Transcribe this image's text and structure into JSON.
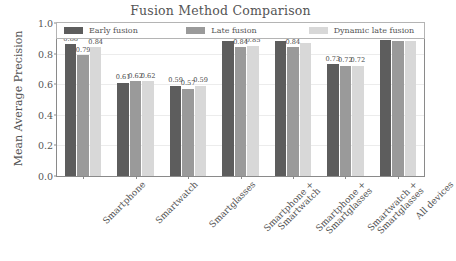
{
  "chart_data": {
    "type": "bar",
    "title": "Fusion Method Comparison",
    "xlabel": "",
    "ylabel": "Mean Average Precision",
    "ylim": [
      0.0,
      1.0
    ],
    "yticks": [
      "0.0",
      "0.2",
      "0.4",
      "0.6",
      "0.8",
      "1.0"
    ],
    "grid": true,
    "legend_position": "upper center",
    "categories": [
      "Smartphone",
      "Smartwatch",
      "Smartglasses",
      "Smartphone +\nSmartwatch",
      "Smartphone +\nSmartglasses",
      "Smartwatch +\nSmartglasses",
      "All devices"
    ],
    "series": [
      {
        "name": "Early fusion",
        "color": "#5d5d5d",
        "values": [
          0.86,
          0.61,
          0.59,
          0.88,
          0.88,
          0.73,
          0.89
        ],
        "labels": [
          "0.86",
          "0.61",
          "0.59",
          "0.88",
          "0.88",
          "0.73",
          "0.89"
        ]
      },
      {
        "name": "Late fusion",
        "color": "#9a9a9a",
        "values": [
          0.79,
          0.62,
          0.57,
          0.84,
          0.84,
          0.72,
          0.88
        ],
        "labels": [
          "0.79",
          "0.62",
          "0.57",
          "0.84",
          "0.84",
          "0.72",
          "0.88"
        ]
      },
      {
        "name": "Dynamic late fusion",
        "color": "#d8d8d8",
        "values": [
          0.84,
          0.62,
          0.59,
          0.85,
          0.87,
          0.72,
          0.88
        ],
        "labels": [
          "0.84",
          "0.62",
          "0.59",
          "0.85",
          "0.87",
          "0.72",
          "0.88"
        ]
      }
    ]
  }
}
